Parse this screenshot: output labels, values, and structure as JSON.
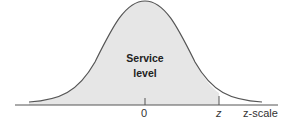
{
  "diagram": {
    "type": "normal-distribution",
    "shaded_region_label_line1": "Service",
    "shaded_region_label_line2": "level",
    "axis_ticks": [
      "0",
      "z"
    ],
    "axis_label": "z-scale",
    "colors": {
      "fill": "#e6e6e6",
      "curve": "#555555",
      "axis": "#555555"
    }
  }
}
